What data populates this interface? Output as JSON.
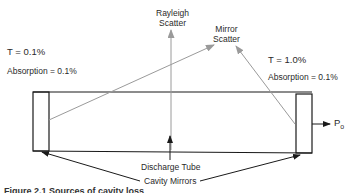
{
  "diagram": {
    "left_mirror": {
      "transmission_label": "T = 0.1%",
      "absorption_label": "Absorption = 0.1%"
    },
    "right_mirror": {
      "transmission_label": "T = 1.0%",
      "absorption_label": "Absorption = 0.1%"
    },
    "rayleigh_label": [
      "Rayleigh",
      "Scatter"
    ],
    "mirror_scatter_label": [
      "Mirror",
      "Scatter"
    ],
    "discharge_tube_label": "Discharge Tube",
    "cavity_mirrors_label": "Cavity Mirrors",
    "output_label": "P",
    "output_subscript": "o",
    "caption": "Figure 2.1  Sources of cavity loss"
  },
  "colors": {
    "line": "#1a1a1a",
    "scatter_line": "#9a9a9a"
  }
}
